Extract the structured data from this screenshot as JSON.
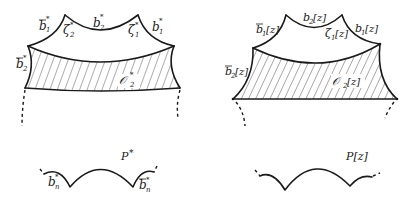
{
  "left_figure": {
    "caption": "P*",
    "labels": {
      "b1bar": {
        "base": "b",
        "bar": true,
        "sub": "1",
        "sup": "*"
      },
      "zeta2": {
        "base": "ζ",
        "sub": "2",
        "sup": "*"
      },
      "b2": {
        "base": "b",
        "sub": "2",
        "sup": "*"
      },
      "zeta1": {
        "base": "ζ",
        "sub": "1",
        "sup": "*"
      },
      "b1": {
        "base": "b",
        "sub": "1",
        "sup": "*"
      },
      "b2bar": {
        "base": "b",
        "bar": true,
        "sub": "2",
        "sup": "*"
      },
      "region": {
        "base": "𝒪",
        "sub": "2",
        "sup": "*"
      },
      "bn": {
        "base": "b",
        "sub": "n",
        "sup": "*"
      },
      "bnbar": {
        "base": "b",
        "bar": true,
        "sub": "n",
        "sup": "*"
      }
    }
  },
  "right_figure": {
    "caption": "P[z]",
    "labels": {
      "b1bar": {
        "base": "b",
        "bar": true,
        "sub": "1",
        "arg": "[z]"
      },
      "b2": {
        "base": "b",
        "sub": "2",
        "arg": "[z]"
      },
      "zeta1": {
        "base": "ζ",
        "sub": "1",
        "arg": "[z]"
      },
      "b1": {
        "base": "b",
        "sub": "1",
        "arg": "[z]"
      },
      "b2bar": {
        "base": "b",
        "bar": true,
        "sub": "2",
        "arg": "[z]"
      },
      "region": {
        "base": "𝒪",
        "sub": "2",
        "arg": "[z]"
      }
    }
  },
  "text": {
    "b": "b",
    "zeta": "ζ",
    "O": "𝒪",
    "star": "*",
    "z": "[z]",
    "one": "1",
    "two": "2",
    "n": "n",
    "cap_left_base": "P",
    "cap_left_sup": "*",
    "cap_right": "P[z]"
  }
}
